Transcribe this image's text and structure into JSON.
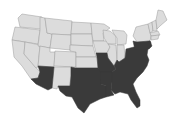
{
  "map": {
    "title": "",
    "region": "Contiguous United States",
    "colors": {
      "highlighted": "#3a3a3a",
      "default": "#dcdcdc",
      "border": "#9a9a9a",
      "background": "#ffffff"
    },
    "highlighted_states": [
      "Arizona",
      "Texas",
      "Oklahoma",
      "Missouri",
      "Arkansas",
      "Louisiana",
      "Mississippi",
      "Alabama",
      "Tennessee",
      "Kentucky",
      "Ohio",
      "West Virginia",
      "Virginia",
      "North Carolina",
      "South Carolina",
      "Georgia",
      "Florida",
      "Pennsylvania",
      "Maryland",
      "Delaware",
      "New Jersey"
    ],
    "other_states": [
      "Washington",
      "Oregon",
      "California",
      "Nevada",
      "Idaho",
      "Montana",
      "Wyoming",
      "Utah",
      "Colorado",
      "New Mexico",
      "North Dakota",
      "South Dakota",
      "Nebraska",
      "Kansas",
      "Minnesota",
      "Iowa",
      "Wisconsin",
      "Illinois",
      "Michigan",
      "Indiana",
      "New York",
      "Vermont",
      "New Hampshire",
      "Maine",
      "Massachusetts",
      "Connecticut",
      "Rhode Island"
    ]
  }
}
